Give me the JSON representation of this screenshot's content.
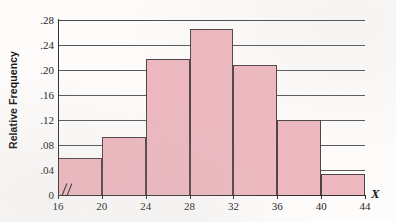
{
  "chart_data": {
    "type": "bar",
    "title": "",
    "subtitle": "",
    "xlabel": "X",
    "ylabel": "Relative Frequency",
    "categories": [
      "16-20",
      "20-24",
      "24-28",
      "28-32",
      "32-36",
      "36-40",
      "40-44"
    ],
    "bin_edges": [
      16,
      20,
      24,
      28,
      32,
      36,
      40,
      44
    ],
    "values": [
      0.06,
      0.093,
      0.218,
      0.265,
      0.208,
      0.12,
      0.033
    ],
    "xlim": [
      16,
      44
    ],
    "ylim": [
      0,
      0.28
    ],
    "x_ticks": [
      "16",
      "20",
      "24",
      "28",
      "32",
      "36",
      "40",
      "44"
    ],
    "x_tick_values": [
      16,
      20,
      24,
      28,
      32,
      36,
      40,
      44
    ],
    "y_ticks": [
      "0",
      ".04",
      ".08",
      ".12",
      ".16",
      ".20",
      ".24",
      ".28"
    ],
    "y_tick_values": [
      0,
      0.04,
      0.08,
      0.12,
      0.16,
      0.2,
      0.24,
      0.28
    ],
    "grid": true,
    "grid_axis": "y",
    "legend": false,
    "axis_break": true,
    "bar_fill_color": "#eeb8c0",
    "bar_border_color": "#4f4244",
    "grid_color": "#585858",
    "axis_color": "#303030"
  }
}
